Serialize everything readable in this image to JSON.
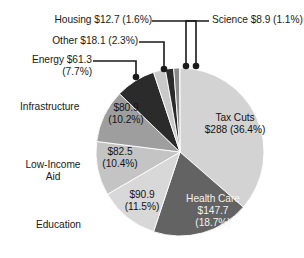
{
  "chart_data": {
    "type": "pie",
    "title": "",
    "subtitle": "",
    "xlabel": "",
    "ylabel": "",
    "legend_position": "none",
    "grid": false,
    "units": "billions of dollars",
    "total": 791.1,
    "categories": [
      "Tax Cuts",
      "Health Care",
      "Education",
      "Low-Income Aid",
      "Infrastructure",
      "Energy",
      "Other",
      "Housing",
      "Science"
    ],
    "values": [
      288,
      147.7,
      90.9,
      82.5,
      80.9,
      61.3,
      18.1,
      12.7,
      8.9
    ],
    "percents": [
      36.4,
      18.7,
      11.5,
      10.4,
      10.2,
      7.7,
      2.3,
      1.6,
      1.1
    ],
    "slices": [
      {
        "name": "Tax Cuts",
        "value": 288,
        "percent": 36.4,
        "color": "#d3d3d3",
        "label_name": "Tax Cuts",
        "label_value": "$288 (36.4%)",
        "label_placement": "inside",
        "callout": false
      },
      {
        "name": "Health Care",
        "value": 147.7,
        "percent": 18.7,
        "color": "#636363",
        "label_name": "Health Care",
        "label_value": "$147.7",
        "label_percent": "(18.7%)",
        "label_placement": "inside",
        "callout": false
      },
      {
        "name": "Education",
        "value": 90.9,
        "percent": 11.5,
        "color": "#d8d8d8",
        "label_name": "Education",
        "label_value": "$90.9",
        "label_percent": "(11.5%)",
        "label_placement": "inside-and-outside",
        "callout": false
      },
      {
        "name": "Low-Income Aid",
        "value": 82.5,
        "percent": 10.4,
        "color": "#c4c4c4",
        "label_name": "Low-Income\nAid",
        "label_value": "$82.5",
        "label_percent": "(10.4%)",
        "label_placement": "inside-and-outside",
        "callout": false
      },
      {
        "name": "Infrastructure",
        "value": 80.9,
        "percent": 10.2,
        "color": "#9e9e9e",
        "label_name": "Infrastructure",
        "label_value": "$80.9",
        "label_percent": "(10.2%)",
        "label_placement": "inside-and-outside",
        "callout": false
      },
      {
        "name": "Energy",
        "value": 61.3,
        "percent": 7.7,
        "color": "#2b2b2b",
        "label_name": "Energy $61.3",
        "label_percent": "(7.7%)",
        "label_placement": "outside",
        "callout": true
      },
      {
        "name": "Other",
        "value": 18.1,
        "percent": 2.3,
        "color": "#c9c9c9",
        "label_name": "Other $18.1 (2.3%)",
        "label_placement": "outside",
        "callout": true
      },
      {
        "name": "Housing",
        "value": 12.7,
        "percent": 1.6,
        "color": "#2b2b2b",
        "label_name": "Housing $12.7 (1.6%)",
        "label_placement": "outside",
        "callout": true
      },
      {
        "name": "Science",
        "value": 8.9,
        "percent": 1.1,
        "color": "#8a8a8a",
        "label_name": "Science $8.9 (1.1%)",
        "label_placement": "outside",
        "callout": true
      }
    ],
    "geometry": {
      "center_x": 180,
      "center_y": 152,
      "radius": 84,
      "start_angle_deg": 0,
      "direction": "clockwise"
    },
    "colors": {
      "background": "#ffffff",
      "text": "#1a1a1a",
      "leader_line": "#1a1a1a",
      "slice_edge": "#ffffff"
    }
  },
  "labels": {
    "housing": "Housing $12.7 (1.6%)",
    "science": "Science $8.9 (1.1%)",
    "other": "Other $18.1 (2.3%)",
    "energy_line1": "Energy $61.3",
    "energy_line2": "(7.7%)",
    "infrastructure": "Infrastructure",
    "low_income_line1": "Low-Income",
    "low_income_line2": "Aid",
    "education": "Education",
    "tax_cuts_line1": "Tax Cuts",
    "tax_cuts_line2": "$288 (36.4%)",
    "health_care_line1": "Health Care",
    "health_care_line2": "$147.7",
    "health_care_line3": "(18.7%)",
    "infra_value_line1": "$80.9",
    "infra_value_line2": "(10.2%)",
    "lowinc_value_line1": "$82.5",
    "lowinc_value_line2": "(10.4%)",
    "edu_value_line1": "$90.9",
    "edu_value_line2": "(11.5%)"
  }
}
